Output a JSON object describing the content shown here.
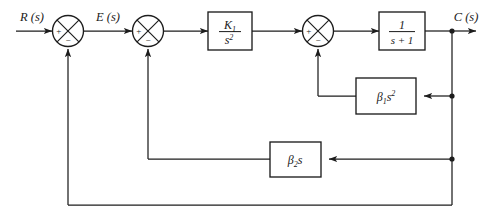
{
  "diagram": {
    "type": "control-system-block-diagram",
    "colors": {
      "line": "#1d1d1d",
      "text": "#1a1a1a",
      "background": "#ffffff"
    },
    "signals": {
      "input_label": "R (s)",
      "error_label": "E (s)",
      "output_label": "C (s)"
    },
    "summing_junctions": [
      {
        "id": "sum-1",
        "name": "summing-junction-1",
        "left_sign": "+",
        "bottom_sign": "−",
        "cx": 68,
        "cy": 31
      },
      {
        "id": "sum-2",
        "name": "summing-junction-2",
        "left_sign": "+",
        "bottom_sign": "−",
        "cx": 148,
        "cy": 31
      },
      {
        "id": "sum-3",
        "name": "summing-junction-3",
        "left_sign": "+",
        "bottom_sign": "−",
        "cx": 318,
        "cy": 31
      }
    ],
    "blocks": [
      {
        "id": "block-k1-s2",
        "name": "transfer-function-block-k1-over-s-squared",
        "numerator": "K",
        "numerator_sub": "1",
        "denominator": "s",
        "denominator_sup": "2",
        "plain": "K1/s^2",
        "x": 208,
        "y": 12,
        "w": 44,
        "h": 38,
        "layout": "fraction"
      },
      {
        "id": "block-1-s-plus-1",
        "name": "transfer-function-block-1-over-s-plus-1",
        "numerator": "1",
        "denominator": "s + 1",
        "plain": "1/(s+1)",
        "x": 379,
        "y": 12,
        "w": 46,
        "h": 38,
        "layout": "fraction"
      },
      {
        "id": "block-beta1-s2",
        "name": "feedback-block-beta1-s-squared",
        "base": "β",
        "sub": "1",
        "var": "s",
        "sup": "2",
        "plain": "β1s²",
        "x": 356,
        "y": 78,
        "w": 60,
        "h": 36,
        "layout": "inline"
      },
      {
        "id": "block-beta2-s",
        "name": "feedback-block-beta2-s",
        "base": "β",
        "sub": "2",
        "var": "s",
        "sup": "",
        "plain": "β2s",
        "x": 270,
        "y": 142,
        "w": 51,
        "h": 35,
        "layout": "inline"
      }
    ],
    "junction_dots": [
      {
        "name": "output-tap-dot",
        "x": 452,
        "y": 31
      },
      {
        "name": "beta1-feedback-tap-dot",
        "x": 452,
        "y": 96
      },
      {
        "name": "beta2-feedback-tap-dot",
        "x": 452,
        "y": 159
      }
    ],
    "loops": [
      {
        "name": "inner-loop-acceleration",
        "from": "C(s)",
        "through": "β1s²",
        "to": "summing-junction-3",
        "sign": "−"
      },
      {
        "name": "inner-loop-rate",
        "from": "C(s)",
        "through": "β2s",
        "to": "summing-junction-2",
        "sign": "−"
      },
      {
        "name": "outer-unity-feedback-loop",
        "from": "C(s)",
        "through": "unity",
        "to": "summing-junction-1",
        "sign": "−"
      }
    ]
  }
}
